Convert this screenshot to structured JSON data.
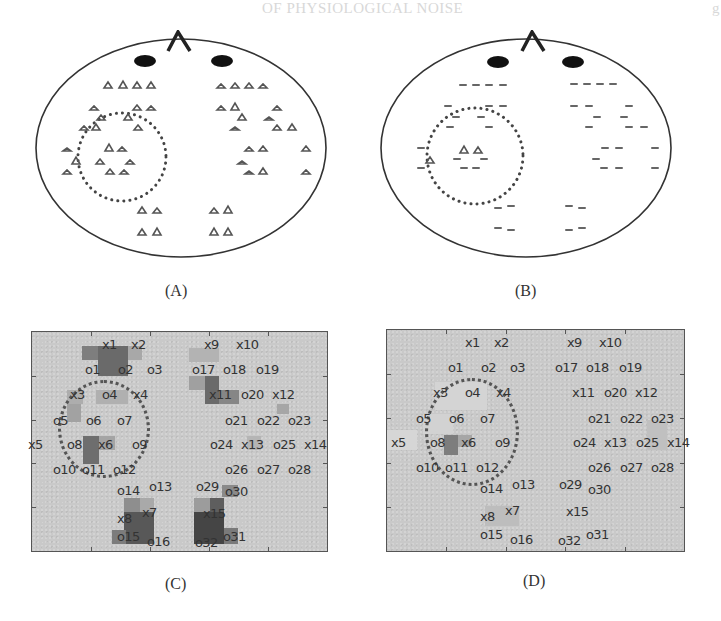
{
  "page": {
    "ghost_heading": "OF PHYSIOLOGICAL NOISE",
    "ghost_right": "g"
  },
  "panels": {
    "A": {
      "label": "(A)",
      "type": "head-sensor-map",
      "markers": "triangles"
    },
    "B": {
      "label": "(B)",
      "type": "head-sensor-map",
      "markers": "faded-triangles"
    },
    "C": {
      "label": "(C)",
      "type": "channel-activation-map"
    },
    "D": {
      "label": "(D)",
      "type": "channel-activation-map"
    }
  },
  "channel_labels": [
    {
      "id": "x1",
      "text": "x1",
      "x": 70,
      "y": 6
    },
    {
      "id": "x2",
      "text": "x2",
      "x": 99,
      "y": 6
    },
    {
      "id": "o1",
      "text": "o1",
      "x": 53,
      "y": 31
    },
    {
      "id": "o2",
      "text": "o2",
      "x": 86,
      "y": 31
    },
    {
      "id": "o3",
      "text": "o3",
      "x": 115,
      "y": 31
    },
    {
      "id": "x3",
      "text": "x3",
      "x": 38,
      "y": 56
    },
    {
      "id": "o4",
      "text": "o4",
      "x": 70,
      "y": 56
    },
    {
      "id": "x4",
      "text": "x4",
      "x": 101,
      "y": 56
    },
    {
      "id": "o5",
      "text": "o5",
      "x": 21,
      "y": 82
    },
    {
      "id": "o6",
      "text": "o6",
      "x": 54,
      "y": 82
    },
    {
      "id": "o7",
      "text": "o7",
      "x": 85,
      "y": 82
    },
    {
      "id": "x5",
      "text": "x5",
      "x": -4,
      "y": 106
    },
    {
      "id": "o8",
      "text": "o8",
      "x": 35,
      "y": 106
    },
    {
      "id": "x6",
      "text": "x6",
      "x": 66,
      "y": 106
    },
    {
      "id": "o9",
      "text": "o9",
      "x": 100,
      "y": 106
    },
    {
      "id": "o10",
      "text": "o10",
      "x": 21,
      "y": 131
    },
    {
      "id": "o11",
      "text": "o11",
      "x": 50,
      "y": 131
    },
    {
      "id": "o12",
      "text": "o12",
      "x": 81,
      "y": 131
    },
    {
      "id": "o14",
      "text": "o14",
      "x": 85,
      "y": 152
    },
    {
      "id": "o13",
      "text": "o13",
      "x": 117,
      "y": 148
    },
    {
      "id": "x8",
      "text": "x8",
      "x": 85,
      "y": 180
    },
    {
      "id": "x7",
      "text": "x7",
      "x": 110,
      "y": 174
    },
    {
      "id": "o15",
      "text": "o15",
      "x": 85,
      "y": 198
    },
    {
      "id": "o16",
      "text": "o16",
      "x": 115,
      "y": 203
    },
    {
      "id": "x9",
      "text": "x9",
      "x": 172,
      "y": 6
    },
    {
      "id": "x10",
      "text": "x10",
      "x": 204,
      "y": 6
    },
    {
      "id": "o17",
      "text": "o17",
      "x": 160,
      "y": 31
    },
    {
      "id": "o18",
      "text": "o18",
      "x": 191,
      "y": 31
    },
    {
      "id": "o19",
      "text": "o19",
      "x": 224,
      "y": 31
    },
    {
      "id": "x11",
      "text": "x11",
      "x": 177,
      "y": 56
    },
    {
      "id": "o20",
      "text": "o20",
      "x": 209,
      "y": 56
    },
    {
      "id": "x12",
      "text": "x12",
      "x": 240,
      "y": 56
    },
    {
      "id": "o21",
      "text": "o21",
      "x": 193,
      "y": 82
    },
    {
      "id": "o22",
      "text": "o22",
      "x": 225,
      "y": 82
    },
    {
      "id": "o23",
      "text": "o23",
      "x": 256,
      "y": 82
    },
    {
      "id": "o24",
      "text": "o24",
      "x": 178,
      "y": 106
    },
    {
      "id": "x13",
      "text": "x13",
      "x": 209,
      "y": 106
    },
    {
      "id": "o25",
      "text": "o25",
      "x": 241,
      "y": 106
    },
    {
      "id": "x14",
      "text": "x14",
      "x": 272,
      "y": 106
    },
    {
      "id": "o26",
      "text": "o26",
      "x": 193,
      "y": 131
    },
    {
      "id": "o27",
      "text": "o27",
      "x": 225,
      "y": 131
    },
    {
      "id": "o28",
      "text": "o28",
      "x": 256,
      "y": 131
    },
    {
      "id": "o29",
      "text": "o29",
      "x": 164,
      "y": 148
    },
    {
      "id": "o30",
      "text": "o30",
      "x": 193,
      "y": 153
    },
    {
      "id": "x15",
      "text": "x15",
      "x": 171,
      "y": 175
    },
    {
      "id": "o32",
      "text": "o32",
      "x": 163,
      "y": 204
    },
    {
      "id": "o31",
      "text": "o31",
      "x": 191,
      "y": 198
    }
  ],
  "heat_cells_C": [
    {
      "x": 50,
      "y": 14,
      "w": 32,
      "h": 14,
      "c": "#7e7e7e"
    },
    {
      "x": 66,
      "y": 14,
      "w": 30,
      "h": 30,
      "c": "#6a6a6a"
    },
    {
      "x": 96,
      "y": 14,
      "w": 14,
      "h": 14,
      "c": "#a8a8a8"
    },
    {
      "x": 35,
      "y": 58,
      "w": 16,
      "h": 14,
      "c": "#adadad"
    },
    {
      "x": 64,
      "y": 58,
      "w": 32,
      "h": 14,
      "c": "#b0b0b0"
    },
    {
      "x": 35,
      "y": 72,
      "w": 14,
      "h": 18,
      "c": "#a2a2a2"
    },
    {
      "x": 51,
      "y": 104,
      "w": 16,
      "h": 28,
      "c": "#6e6e6e"
    },
    {
      "x": 67,
      "y": 104,
      "w": 16,
      "h": 14,
      "c": "#a4a4a4"
    },
    {
      "x": 92,
      "y": 166,
      "w": 16,
      "h": 14,
      "c": "#8e8e8e"
    },
    {
      "x": 108,
      "y": 166,
      "w": 14,
      "h": 14,
      "c": "#a9a9a9"
    },
    {
      "x": 92,
      "y": 180,
      "w": 30,
      "h": 32,
      "c": "#585858"
    },
    {
      "x": 80,
      "y": 198,
      "w": 14,
      "h": 14,
      "c": "#7c7c7c"
    },
    {
      "x": 157,
      "y": 16,
      "w": 30,
      "h": 14,
      "c": "#b3b3b3"
    },
    {
      "x": 157,
      "y": 44,
      "w": 16,
      "h": 14,
      "c": "#a0a0a0"
    },
    {
      "x": 173,
      "y": 44,
      "w": 14,
      "h": 28,
      "c": "#6a6a6a"
    },
    {
      "x": 187,
      "y": 58,
      "w": 20,
      "h": 14,
      "c": "#868686"
    },
    {
      "x": 245,
      "y": 72,
      "w": 12,
      "h": 10,
      "c": "#a6a6a6"
    },
    {
      "x": 215,
      "y": 104,
      "w": 14,
      "h": 14,
      "c": "#b5b5b5"
    },
    {
      "x": 190,
      "y": 153,
      "w": 16,
      "h": 12,
      "c": "#8a8a8a"
    },
    {
      "x": 162,
      "y": 166,
      "w": 16,
      "h": 14,
      "c": "#9c9c9c"
    },
    {
      "x": 178,
      "y": 166,
      "w": 14,
      "h": 14,
      "c": "#5e5e5e"
    },
    {
      "x": 162,
      "y": 180,
      "w": 30,
      "h": 32,
      "c": "#454545"
    },
    {
      "x": 192,
      "y": 196,
      "w": 14,
      "h": 16,
      "c": "#7a7a7a"
    }
  ],
  "heat_cells_D": [
    {
      "x": 48,
      "y": 52,
      "w": 52,
      "h": 28,
      "c": "#d4d4d4"
    },
    {
      "x": 36,
      "y": 84,
      "w": 30,
      "h": 20,
      "c": "#d2d2d2"
    },
    {
      "x": 57,
      "y": 105,
      "w": 14,
      "h": 20,
      "c": "#7d7d7d"
    },
    {
      "x": 71,
      "y": 105,
      "w": 14,
      "h": 12,
      "c": "#a6a6a6"
    },
    {
      "x": 0,
      "y": 100,
      "w": 30,
      "h": 20,
      "c": "#d6d6d6"
    },
    {
      "x": 98,
      "y": 176,
      "w": 34,
      "h": 20,
      "c": "#bdbdbd"
    },
    {
      "x": 260,
      "y": 90,
      "w": 20,
      "h": 30,
      "c": "#c0c0c0"
    }
  ]
}
